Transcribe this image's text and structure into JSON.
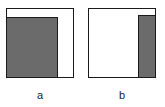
{
  "panels": [
    {
      "label": "a",
      "outer": {
        "x": 6,
        "y": 8,
        "w": 68,
        "h": 70
      },
      "inner": {
        "x": 6,
        "y": 17,
        "w": 52,
        "h": 61
      },
      "fill_color": "#6b6b6b"
    },
    {
      "label": "b",
      "outer": {
        "x": 88,
        "y": 8,
        "w": 68,
        "h": 70
      },
      "inner": {
        "x": 138,
        "y": 15,
        "w": 18,
        "h": 63
      },
      "fill_color": "#6b6b6b"
    }
  ]
}
